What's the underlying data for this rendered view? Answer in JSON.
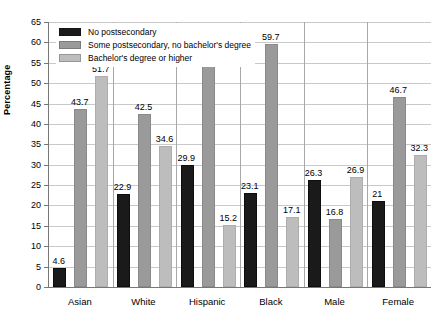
{
  "chart_data": {
    "type": "bar",
    "title": "",
    "xlabel": "",
    "ylabel": "Percentage",
    "ylim": [
      0,
      65
    ],
    "ytick_step": 5,
    "yticks": [
      0,
      5,
      10,
      15,
      20,
      25,
      30,
      35,
      40,
      45,
      50,
      55,
      60,
      65
    ],
    "grid": true,
    "legend_position": "top-left",
    "categories": [
      "Asian",
      "White",
      "Hispanic",
      "Black",
      "Male",
      "Female"
    ],
    "series": [
      {
        "name": "No postsecondary",
        "color": "#1a1a1a",
        "values": [
          4.6,
          22.9,
          29.9,
          23.1,
          26.3,
          21
        ],
        "labels": [
          "4.6",
          "22.9",
          "29.9",
          "23.1",
          "26.3",
          "21"
        ]
      },
      {
        "name": "Some postsecondary, no bachelor's degree",
        "color": "#9a9a9a",
        "values": [
          43.7,
          42.5,
          54.9,
          59.7,
          16.8,
          46.7
        ],
        "labels": [
          "43.7",
          "42.5",
          "54.9",
          "59.7",
          "16.8",
          "46.7"
        ]
      },
      {
        "name": "Bachelor's degree or higher",
        "color": "#bdbdbd",
        "values": [
          51.7,
          34.6,
          15.2,
          17.1,
          26.9,
          32.3
        ],
        "labels": [
          "51.7",
          "34.6",
          "15.2",
          "17.1",
          "26.9",
          "32.3"
        ]
      }
    ]
  },
  "legend": {
    "items": [
      {
        "label": "No postsecondary"
      },
      {
        "label": "Some postsecondary, no bachelor's degree"
      },
      {
        "label": "Bachelor's degree or higher"
      }
    ]
  },
  "axis": {
    "y_title": "Percentage"
  }
}
